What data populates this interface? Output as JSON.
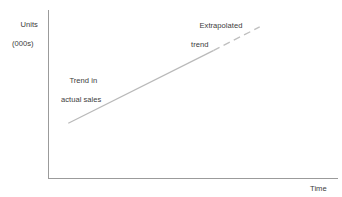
{
  "chart_data": {
    "type": "line",
    "title": "",
    "subtitle": "",
    "xlabel": "Time",
    "ylabel": "Units\n(000s)",
    "ylabel_line1": "Units",
    "ylabel_line2": "(000s)",
    "grid": false,
    "legend_position": "none",
    "axis_ticks": {
      "x": [],
      "y": []
    },
    "axis_ranges": {
      "xlim": [
        0,
        10
      ],
      "ylim": [
        0,
        10
      ]
    },
    "series": [
      {
        "name": "Trend in actual sales",
        "style": "solid",
        "color": "#b9b9b9",
        "x": [
          0.7,
          5.7
        ],
        "y": [
          3.3,
          7.6
        ],
        "points": [
          [
            0.7,
            3.3
          ],
          [
            5.7,
            7.6
          ]
        ]
      },
      {
        "name": "Extrapolated trend",
        "style": "dashed",
        "color": "#bfbfbf",
        "x": [
          5.7,
          7.3
        ],
        "y": [
          7.6,
          9.0
        ],
        "points": [
          [
            5.7,
            7.6
          ],
          [
            7.3,
            9.0
          ]
        ]
      }
    ],
    "annotations": [
      {
        "id": "actual",
        "line1": "Trend in",
        "line2": "actual sales",
        "target_series": "Trend in actual sales"
      },
      {
        "id": "extrapolated",
        "line1": "Extrapolated",
        "line2": "trend",
        "target_series": "Extrapolated trend"
      }
    ],
    "colors": {
      "axis": "#9b9b9b",
      "text": "#3c3c3c",
      "solid_line": "#b9b9b9",
      "dashed_line": "#bfbfbf",
      "background": "#ffffff"
    }
  },
  "axes": {
    "x_title": "Time",
    "y_title_line1": "Units",
    "y_title_line2": "(000s)"
  },
  "labels": {
    "actual_line1": "Trend in",
    "actual_line2": "actual sales",
    "extrapolated_line1": "Extrapolated",
    "extrapolated_line2": "trend"
  }
}
